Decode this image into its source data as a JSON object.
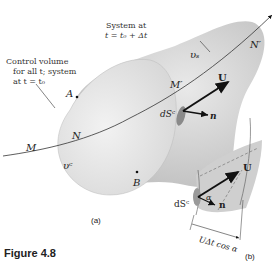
{
  "figure": {
    "caption_prefix": "Figure 4.8",
    "part_a_label": "(a)",
    "part_b_label": "(b)"
  },
  "labels": {
    "system_note_line1": "System at",
    "system_note_line2": "t = t₀ + Δt",
    "cv_note_line1": "Control volume",
    "cv_note_line2": "for all t; system",
    "cv_note_line3": "at t = t₀",
    "point_A": "A",
    "point_B": "B",
    "point_M": "M",
    "point_N": "N",
    "point_M_prime": "M′",
    "point_N_prime": "N′",
    "volume_s": "υₛ",
    "volume_c": "υᶜ",
    "velocity_U": "U",
    "normal_n": "n",
    "area_dSc": "dSᶜ",
    "inset_U": "U",
    "inset_n": "n",
    "inset_alpha": "α",
    "inset_dSc": "dSᶜ",
    "inset_dimension": "UΔt cos α"
  },
  "colors": {
    "system_fill": "#cfcfcf",
    "cv_fill": "#e4e4e4",
    "dark_patch": "#8a8a8a",
    "line": "#333333",
    "arrow": "#111111"
  }
}
